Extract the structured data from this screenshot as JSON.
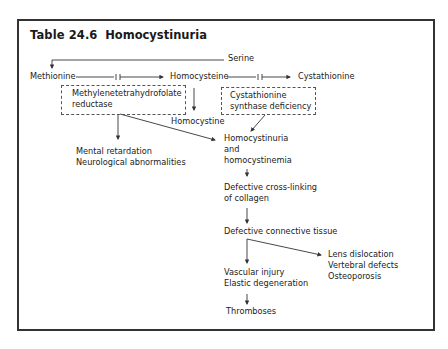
{
  "title": {
    "number": "Table 24.6",
    "name": "Homocystinuria"
  },
  "pathway": {
    "serine": "Serine",
    "methionine": "Methionine",
    "homocysteine": "Homocysteine",
    "cystathionine": "Cystathionine",
    "homocystine": "Homocystine"
  },
  "enzyme_boxes": {
    "mthfr": {
      "line1": "Methylenetetrahydrofolate",
      "line2": "reductase"
    },
    "cbs": {
      "line1": "Cystathionine",
      "line2": "synthase deficiency"
    }
  },
  "outcomes": {
    "neuro": {
      "line1": "Mental retardation",
      "line2": "Neurological abnormalities"
    },
    "homocystinuria": {
      "line1": "Homocystinuria",
      "line2": "and",
      "line3": "homocystinemia"
    },
    "collagen": {
      "line1": "Defective cross-linking",
      "line2": "of collagen"
    },
    "connective": "Defective connective tissue",
    "skeletal": {
      "line1": "Lens dislocation",
      "line2": "Vertebral defects",
      "line3": "Osteoporosis"
    },
    "vascular": {
      "line1": "Vascular injury",
      "line2": "Elastic degeneration"
    },
    "thromboses": "Thromboses"
  },
  "colors": {
    "line": "#333333",
    "text": "#222222",
    "frame": "#333333"
  }
}
